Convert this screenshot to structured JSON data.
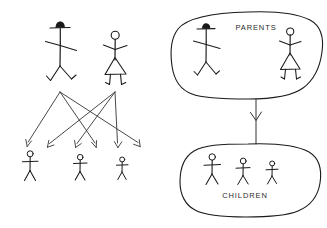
{
  "diagram": {
    "background_color": "#ffffff",
    "ink_color": "#1a1a1a",
    "arrow_color": "#333333",
    "panels": [
      {
        "id": "left",
        "name": "crossing-arrows-panel",
        "description": "Two adult stick figures above, six arrows fanning down and crossing to three child stick figures"
      },
      {
        "id": "right",
        "name": "grouped-blobs-panel",
        "description": "Two hand-drawn enclosing blobs labelled PARENTS and CHILDREN joined by a downward arrow"
      }
    ],
    "labels": {
      "parents": "PARENTS",
      "children": "CHILDREN"
    },
    "figures": {
      "left_panel": {
        "adults": [
          {
            "name": "father-figure",
            "headwear": "hat",
            "x": 60,
            "y": 30
          },
          {
            "name": "mother-figure",
            "headwear": "none",
            "skirt": true,
            "x": 115,
            "y": 33
          }
        ],
        "children": [
          {
            "name": "child-figure-1",
            "x": 30,
            "y": 155
          },
          {
            "name": "child-figure-2",
            "x": 80,
            "y": 158
          },
          {
            "name": "child-figure-3",
            "x": 122,
            "y": 160
          }
        ]
      },
      "right_panel": {
        "parents": [
          {
            "name": "father-figure",
            "headwear": "hat",
            "x": 206,
            "y": 28
          },
          {
            "name": "mother-figure",
            "headwear": "none",
            "skirt": true,
            "x": 290,
            "y": 30
          }
        ],
        "children": [
          {
            "name": "child-figure-1",
            "x": 212,
            "y": 158
          },
          {
            "name": "child-figure-2",
            "x": 243,
            "y": 162
          },
          {
            "name": "child-figure-3",
            "x": 272,
            "y": 164
          }
        ]
      }
    },
    "connections": {
      "left_panel": {
        "description": "six arrows from two parent anchor points to six arrowhead targets",
        "sources": [
          {
            "name": "father-anchor",
            "x": 60,
            "y": 92
          },
          {
            "name": "mother-anchor",
            "x": 115,
            "y": 92
          }
        ],
        "targets": [
          {
            "x": 27,
            "y": 146
          },
          {
            "x": 48,
            "y": 148
          },
          {
            "x": 78,
            "y": 148
          },
          {
            "x": 96,
            "y": 148
          },
          {
            "x": 118,
            "y": 148
          },
          {
            "x": 140,
            "y": 147
          }
        ]
      },
      "right_panel": {
        "description": "single vertical arrow from PARENTS blob down to CHILDREN blob",
        "from": "parents-blob",
        "to": "children-blob",
        "x": 256,
        "y_start": 99,
        "y_end": 144
      }
    }
  }
}
